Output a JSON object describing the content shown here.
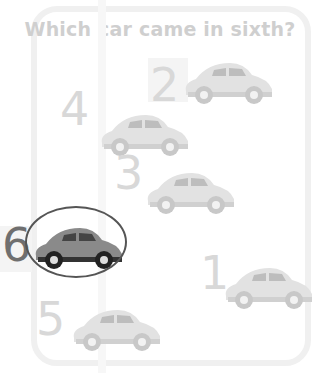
{
  "question": "Which car came in sixth?",
  "answer_position": 6,
  "cars": [
    {
      "label": "2",
      "x": 178,
      "y": 57,
      "numX": 150,
      "numY": 62,
      "selected": false
    },
    {
      "label": "4",
      "x": 94,
      "y": 109,
      "numX": 60,
      "numY": 86,
      "selected": false
    },
    {
      "label": "3",
      "x": 140,
      "y": 167,
      "numX": 114,
      "numY": 150,
      "selected": false
    },
    {
      "label": "6",
      "x": 28,
      "y": 222,
      "numX": 2,
      "numY": 222,
      "selected": true
    },
    {
      "label": "1",
      "x": 218,
      "y": 262,
      "numX": 200,
      "numY": 250,
      "selected": false
    },
    {
      "label": "5",
      "x": 66,
      "y": 304,
      "numX": 36,
      "numY": 296,
      "selected": false
    }
  ],
  "colors": {
    "faded": "#d8d8d8",
    "highlight": "#6f6f6f",
    "ellipse": "#555555"
  }
}
